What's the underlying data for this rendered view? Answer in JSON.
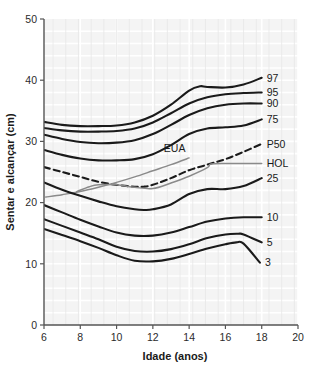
{
  "chart_data": {
    "type": "line",
    "title": "",
    "xlabel": "Idade (anos)",
    "ylabel": "Sentar e alcançar (cm)",
    "xlim": [
      6,
      20
    ],
    "ylim": [
      0,
      50
    ],
    "xticks": [
      6,
      8,
      10,
      12,
      14,
      16,
      18,
      20
    ],
    "yticks": [
      0,
      10,
      20,
      30,
      40,
      50
    ],
    "grid": true,
    "legend_position": "right-inline-labels",
    "series": [
      {
        "name": "97",
        "label": "97",
        "style": "solid",
        "color": "#1a1a1a",
        "x": [
          6,
          7,
          8,
          9,
          10,
          11,
          12,
          13,
          14,
          14.6,
          15,
          16,
          17,
          18
        ],
        "values": [
          33.2,
          32.7,
          32.5,
          32.5,
          32.6,
          33.1,
          34.2,
          36.0,
          38.3,
          39.0,
          38.9,
          38.8,
          39.3,
          40.4
        ]
      },
      {
        "name": "95",
        "label": "95",
        "style": "solid",
        "color": "#1a1a1a",
        "x": [
          6,
          7,
          8,
          9,
          10,
          11,
          12,
          13,
          14,
          15,
          16,
          17,
          18
        ],
        "values": [
          32.2,
          31.8,
          31.6,
          31.6,
          31.7,
          32.1,
          33.1,
          34.6,
          36.2,
          37.2,
          37.7,
          37.9,
          38.0
        ]
      },
      {
        "name": "90",
        "label": "90",
        "style": "solid",
        "color": "#1a1a1a",
        "x": [
          6,
          7,
          8,
          9,
          10,
          11,
          12,
          13,
          14,
          15,
          16,
          17,
          18
        ],
        "values": [
          31.1,
          30.4,
          29.9,
          29.7,
          29.8,
          30.2,
          31.2,
          32.7,
          34.3,
          35.4,
          36.0,
          36.2,
          36.2
        ]
      },
      {
        "name": "75",
        "label": "75",
        "style": "solid",
        "color": "#1a1a1a",
        "x": [
          6,
          7,
          8,
          9,
          10,
          11,
          12,
          13,
          14,
          15,
          16,
          17,
          18
        ],
        "values": [
          28.6,
          27.8,
          27.2,
          26.9,
          26.9,
          27.1,
          27.9,
          29.4,
          31.2,
          32.1,
          32.3,
          32.6,
          33.6
        ]
      },
      {
        "name": "P50",
        "label": "P50",
        "style": "dashed",
        "color": "#1a1a1a",
        "x": [
          6,
          7,
          8,
          9,
          10,
          11,
          11.5,
          12,
          13,
          14,
          15,
          16,
          17,
          18
        ],
        "values": [
          25.8,
          25.0,
          24.2,
          23.4,
          22.9,
          22.6,
          22.6,
          22.9,
          24.0,
          25.3,
          26.2,
          27.1,
          28.3,
          29.6
        ]
      },
      {
        "name": "HOL",
        "label": "HOL",
        "style": "solid",
        "color": "#8a8a8a",
        "x": [
          7.8,
          8.5,
          9,
          10,
          11,
          12,
          13,
          14,
          15,
          15.2,
          16,
          17,
          18
        ],
        "values": [
          21.8,
          22.6,
          22.9,
          22.9,
          22.5,
          22.3,
          23.2,
          24.3,
          25.7,
          26.3,
          26.4,
          26.4,
          26.4
        ]
      },
      {
        "name": "EUA",
        "label": "EUA",
        "style": "solid",
        "color": "#8a8a8a",
        "x": [
          6.1,
          7,
          8,
          9,
          10,
          11,
          12,
          13,
          14
        ],
        "values": [
          20.9,
          21.3,
          21.8,
          22.5,
          23.3,
          24.2,
          25.2,
          26.2,
          27.3
        ]
      },
      {
        "name": "25",
        "label": "25",
        "style": "solid",
        "color": "#1a1a1a",
        "x": [
          6,
          7,
          8,
          9,
          10,
          11,
          11.5,
          12,
          13,
          14,
          15,
          16,
          17,
          18
        ],
        "values": [
          23.3,
          22.1,
          21.1,
          20.2,
          19.4,
          18.9,
          18.8,
          18.9,
          19.7,
          21.4,
          22.2,
          22.2,
          22.7,
          24.0
        ]
      },
      {
        "name": "10",
        "label": "10",
        "style": "solid",
        "color": "#1a1a1a",
        "x": [
          6,
          7,
          8,
          9,
          10,
          11,
          12,
          13,
          14,
          15,
          16,
          17,
          18
        ],
        "values": [
          19.6,
          18.4,
          17.2,
          16.1,
          15.1,
          14.6,
          14.6,
          15.1,
          16.0,
          16.9,
          17.4,
          17.6,
          17.6
        ]
      },
      {
        "name": "5",
        "label": "5",
        "style": "solid",
        "color": "#1a1a1a",
        "x": [
          6,
          7,
          8,
          9,
          10,
          11,
          12,
          13,
          14,
          15,
          16,
          16.7,
          17,
          18
        ],
        "values": [
          17.3,
          16.2,
          15.1,
          14.0,
          12.8,
          12.1,
          12.0,
          12.4,
          13.2,
          14.2,
          14.8,
          14.9,
          14.8,
          13.5
        ]
      },
      {
        "name": "3",
        "label": "3",
        "style": "solid",
        "color": "#1a1a1a",
        "x": [
          6,
          7,
          8,
          9,
          10,
          11,
          12,
          13,
          14,
          15,
          16,
          16.6,
          17,
          17.9
        ],
        "values": [
          15.7,
          14.7,
          13.7,
          12.6,
          11.4,
          10.5,
          10.4,
          10.8,
          11.6,
          12.5,
          13.2,
          13.5,
          13.3,
          10.2
        ]
      }
    ],
    "annotations": [
      {
        "text": "EUA",
        "x": 13.2,
        "y": 28.2
      }
    ]
  }
}
